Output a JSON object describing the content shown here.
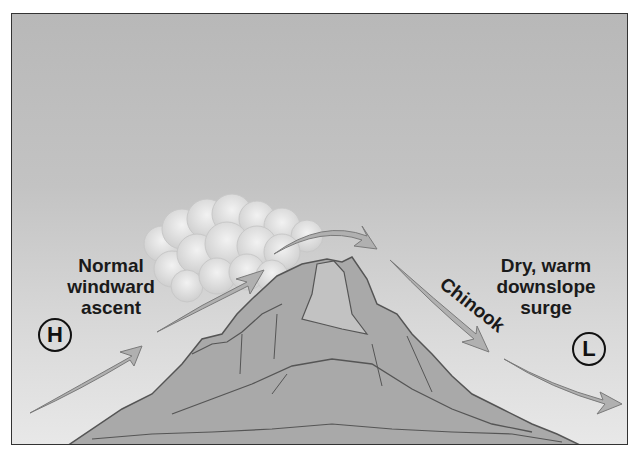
{
  "diagram": {
    "labels": {
      "windward": [
        "Normal",
        "windward",
        "ascent"
      ],
      "leeward": [
        "Dry, warm",
        "downslope",
        "surge"
      ],
      "chinook": "Chinook"
    },
    "pressure": {
      "high": "H",
      "low": "L"
    },
    "colors": {
      "sky_top": "#b8b8b8",
      "sky_bottom": "#e8e8e8",
      "mountain": "#a9a9a9",
      "mountain_light": "#c2c2c2",
      "arrow": "#b0b0b0",
      "outline": "#555555",
      "cloud": "#e4e4e4"
    },
    "elements": [
      "high-pressure-circle",
      "low-pressure-circle",
      "mountain",
      "cloud-mass",
      "windward-arrows",
      "leeward-arrows"
    ]
  }
}
